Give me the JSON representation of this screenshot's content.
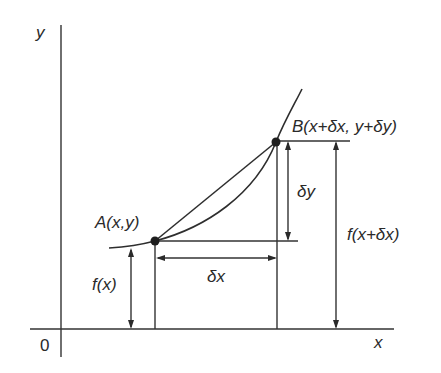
{
  "diagram": {
    "axes": {
      "y_label": "y",
      "x_label": "x",
      "origin_label": "0"
    },
    "points": {
      "A": {
        "label": "A(x,y)"
      },
      "B": {
        "label": "B(x+δx, y+δy)"
      }
    },
    "dimensions": {
      "fx": "f(x)",
      "fxdx": "f(x+δx)",
      "dx": "δx",
      "dy": "δy"
    },
    "colors": {
      "line": "#333333",
      "text": "#2a2a2a",
      "background": "#ffffff"
    }
  }
}
